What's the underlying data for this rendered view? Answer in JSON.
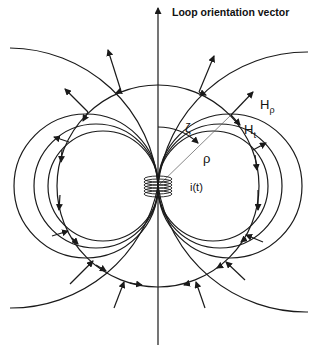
{
  "diagram": {
    "title": "Loop orientation vector",
    "labels": {
      "h_rho": "H",
      "h_rho_sub": "ρ",
      "h_t": "H",
      "h_t_sub": "t",
      "zeta": "ζ",
      "rho": "ρ",
      "current": "i(t)"
    },
    "elements": [
      "loop-orientation-axis",
      "coil",
      "magnetic-field-lines",
      "constant-rho-circle",
      "radial-field-vectors",
      "tangential-field-vectors"
    ],
    "colors": {
      "line": "#1a1a1a",
      "background": "#ffffff"
    }
  }
}
